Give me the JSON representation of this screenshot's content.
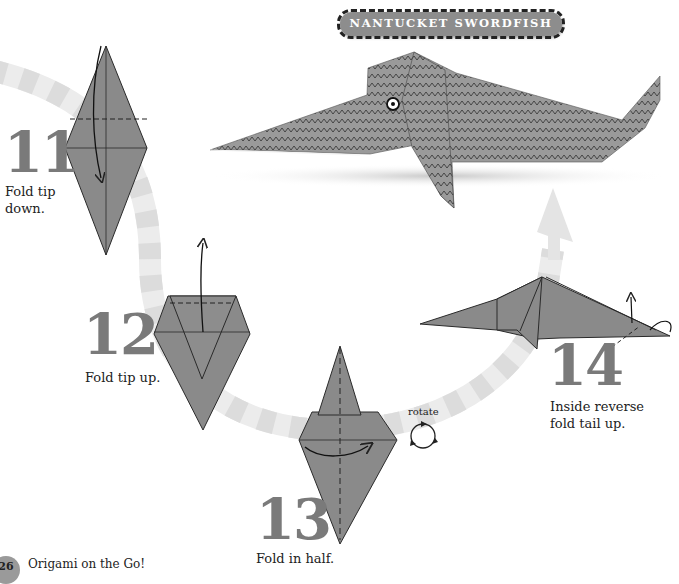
{
  "page": {
    "banner_title": "NANTUCKET SWORDFISH",
    "footer": {
      "page_number": "26",
      "book_title": "Origami on the Go!"
    }
  },
  "steps": [
    {
      "number": "11",
      "caption_line1": "Fold tip",
      "caption_line2": "down."
    },
    {
      "number": "12",
      "caption_line1": "Fold tip up.",
      "caption_line2": ""
    },
    {
      "number": "13",
      "caption_line1": "Fold in half.",
      "caption_line2": ""
    },
    {
      "number": "14",
      "caption_line1": "Inside reverse",
      "caption_line2": "fold tail up."
    }
  ],
  "symbols": {
    "rotate_label": "rotate"
  },
  "colors": {
    "paper": "#8a8a8a",
    "paper_dark": "#6f6f6f",
    "outline": "#2a2a2a",
    "step_number": "#7a7a7a",
    "arc_light": "#ececec",
    "arc_dark": "#dadada",
    "banner_bg": "#8d8d8d"
  }
}
